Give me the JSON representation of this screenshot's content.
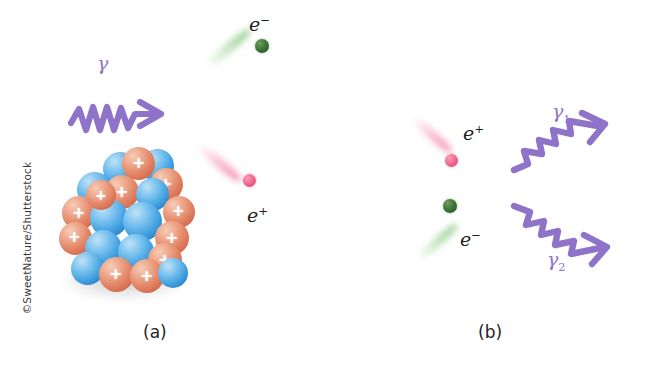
{
  "figure": {
    "background_color": "#ffffff",
    "width": 656,
    "height": 378
  },
  "credit": {
    "text": "©SweetNature/Shutterstock",
    "orientation": "vertical-left",
    "color": "#3a3a3a"
  },
  "colors": {
    "photon_purple": "#8f73c9",
    "photon_purple_dark": "#7d5fbb",
    "electron_green": "#3f7a3a",
    "electron_trail": "#a9dba0",
    "positron_pink": "#e8608c",
    "positron_trail": "#f7aac6",
    "proton_red": "#df7d5e",
    "neutron_blue": "#3f9fe0",
    "label_black": "#1d1d1d"
  },
  "panels": [
    {
      "id": "a",
      "label": "(a)",
      "description": "Pair production: an incoming gamma photon strikes a nucleus and creates an electron-positron pair",
      "elements": {
        "photon_label": "γ",
        "electron_label": "e",
        "electron_charge": "−",
        "positron_label": "e",
        "positron_charge": "+",
        "nucleus": {
          "proton_marker": "+",
          "proton_count": 12,
          "neutron_count": 11
        }
      }
    },
    {
      "id": "b",
      "label": "(b)",
      "description": "Pair annihilation: an electron and a positron meet and produce two gamma photons",
      "elements": {
        "positron_label": "e",
        "positron_charge": "+",
        "electron_label": "e",
        "electron_charge": "−",
        "photon1_label": "γ",
        "photon1_sub": "1",
        "photon2_label": "γ",
        "photon2_sub": "2"
      }
    }
  ]
}
